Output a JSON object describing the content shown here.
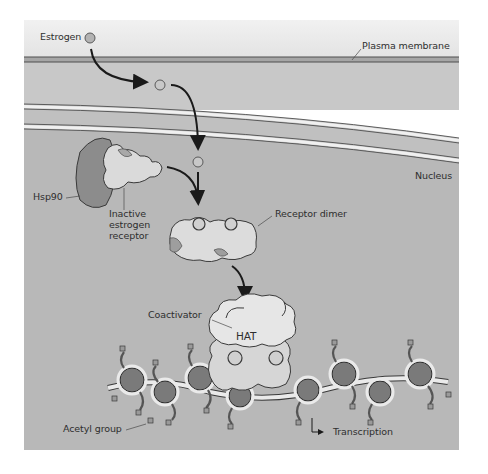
{
  "figure": {
    "labels": {
      "estrogen": "Estrogen",
      "plasma_membrane": "Plasma membrane",
      "nucleus": "Nucleus",
      "hsp90": "Hsp90",
      "inactive_receptor_line1": "Inactive",
      "inactive_receptor_line2": "estrogen",
      "inactive_receptor_line3": "receptor",
      "receptor_dimer": "Receptor dimer",
      "coactivator": "Coactivator",
      "hat": "HAT",
      "acetyl_group": "Acetyl group",
      "transcription": "Transcription"
    },
    "colors": {
      "extracellular": "#ececec",
      "cytoplasm": "#c4c4c4",
      "nucleus": "#b5b5b5",
      "membrane_line": "#5a5a5a",
      "hsp90": "#8a8a8a",
      "receptor": "#d8d8d8",
      "receptor_shadow": "#9c9c9c",
      "coactivator": "#e4e4e4",
      "nucleosome": "#7a7a7a",
      "dna": "#e8e8e8",
      "arrow": "#1a1a1a",
      "text": "#2e2e2e"
    }
  }
}
